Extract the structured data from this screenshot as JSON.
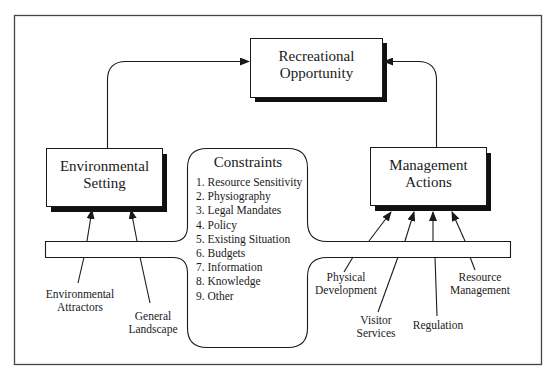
{
  "diagram": {
    "nodes": {
      "recreational_opportunity": {
        "line1": "Recreational",
        "line2": "Opportunity"
      },
      "environmental_setting": {
        "line1": "Environmental",
        "line2": "Setting"
      },
      "management_actions": {
        "line1": "Management",
        "line2": "Actions"
      },
      "constraints": {
        "title": "Constraints",
        "items": [
          "1. Resource Sensitivity",
          "2. Physiography",
          "3. Legal Mandates",
          "4. Policy",
          "5. Existing Situation",
          "6. Budgets",
          "7. Information",
          "8. Knowledge",
          "9. Other"
        ]
      }
    },
    "environmental_inputs": [
      {
        "line1": "Environmental",
        "line2": "Attractors"
      },
      {
        "line1": "General",
        "line2": "Landscape"
      }
    ],
    "management_inputs": [
      {
        "line1": "Physical",
        "line2": "Development"
      },
      {
        "line1": "Visitor",
        "line2": "Services"
      },
      {
        "line1": "Regulation",
        "line2": ""
      },
      {
        "line1": "Resource",
        "line2": "Management"
      }
    ],
    "edges": [
      {
        "from": "Environmental Setting",
        "to": "Recreational Opportunity"
      },
      {
        "from": "Management Actions",
        "to": "Recreational Opportunity"
      },
      {
        "from": "Environmental Attractors",
        "to": "Environmental Setting"
      },
      {
        "from": "General Landscape",
        "to": "Environmental Setting"
      },
      {
        "from": "Physical Development",
        "to": "Management Actions"
      },
      {
        "from": "Visitor Services",
        "to": "Management Actions"
      },
      {
        "from": "Regulation",
        "to": "Management Actions"
      },
      {
        "from": "Resource Management",
        "to": "Management Actions"
      }
    ],
    "colors": {
      "line": "#1a1a1a",
      "shadow": "#111111",
      "background": "#ffffff"
    }
  }
}
